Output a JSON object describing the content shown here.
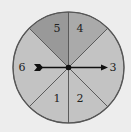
{
  "diagram": {
    "type": "spinner",
    "background": "#ededed",
    "center": [
      68.5,
      67.5
    ],
    "radius": 55.5,
    "outline_color": "#555555",
    "sectors": [
      {
        "label": "5",
        "start_deg": 90,
        "end_deg": 135,
        "color": "#999999",
        "label_pos": [
          57,
          32
        ]
      },
      {
        "label": "4",
        "start_deg": 45,
        "end_deg": 90,
        "color": "#aaaaaa",
        "label_pos": [
          80,
          32
        ]
      },
      {
        "label": "3",
        "start_deg": -45,
        "end_deg": 45,
        "color": "#c3c3c3",
        "label_pos": [
          113,
          71
        ]
      },
      {
        "label": "2",
        "start_deg": -90,
        "end_deg": -45,
        "color": "#c3c3c3",
        "label_pos": [
          80,
          102
        ]
      },
      {
        "label": "1",
        "start_deg": -135,
        "end_deg": -90,
        "color": "#c3c3c3",
        "label_pos": [
          57,
          102
        ]
      },
      {
        "label": "6",
        "start_deg": 135,
        "end_deg": 225,
        "color": "#c3c3c3",
        "label_pos": [
          22,
          71
        ]
      }
    ],
    "pointer": {
      "from": [
        34,
        67.5
      ],
      "to": [
        108,
        67.5
      ],
      "color": "#111111",
      "points_to": "3"
    }
  }
}
